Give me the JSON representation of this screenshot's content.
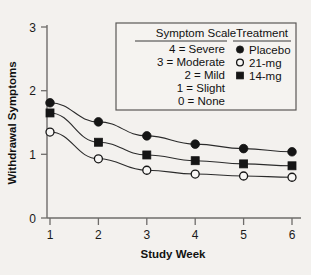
{
  "chart_data": {
    "type": "line",
    "title": "",
    "xlabel": "Study Week",
    "ylabel": "Withdrawal Symptoms",
    "x": [
      1,
      2,
      3,
      4,
      5,
      6
    ],
    "categories": [
      "1",
      "2",
      "3",
      "4",
      "5",
      "6"
    ],
    "xtick_labels": [
      "1",
      "2",
      "3",
      "4",
      "5",
      "6"
    ],
    "ytick_labels": [
      "0",
      "1",
      "2",
      "3"
    ],
    "ytick_values": [
      0,
      1,
      2,
      3
    ],
    "xlim": [
      1,
      6
    ],
    "ylim": [
      0,
      3
    ],
    "grid": false,
    "legend_position": "top-center-inside",
    "series": [
      {
        "name": "Placebo",
        "marker": "filled-circle",
        "values": [
          1.81,
          1.51,
          1.29,
          1.16,
          1.09,
          1.04
        ]
      },
      {
        "name": "14-mg",
        "marker": "filled-square",
        "values": [
          1.65,
          1.19,
          0.99,
          0.9,
          0.85,
          0.82
        ]
      },
      {
        "name": "21-mg",
        "marker": "open-circle",
        "values": [
          1.35,
          0.93,
          0.75,
          0.69,
          0.66,
          0.64
        ]
      }
    ]
  },
  "legend": {
    "symptom_scale_header": "Symptom Scale",
    "treatment_header": "Treatment",
    "scale_items": [
      "4 = Severe",
      "3 = Moderate",
      "2 = Mild",
      "1 = Slight",
      "0 = None"
    ],
    "treatment_items": [
      {
        "label": "Placebo",
        "marker": "filled-circle"
      },
      {
        "label": "21-mg",
        "marker": "open-circle"
      },
      {
        "label": "14-mg",
        "marker": "filled-square"
      }
    ]
  },
  "colors": {
    "background": "#f3f1ee",
    "ink": "#151515",
    "axis": "#6e6c6a",
    "legend_border": "#5a5856"
  }
}
